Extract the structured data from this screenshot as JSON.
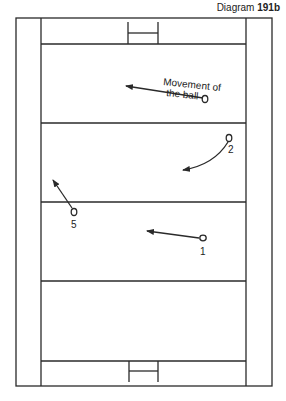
{
  "caption": {
    "prefix": "Diagram",
    "number": "191b"
  },
  "annotation": {
    "line1": "Movement of",
    "line2": "the ball"
  },
  "players": [
    {
      "label": "1"
    },
    {
      "label": "2"
    },
    {
      "label": "5"
    }
  ],
  "colors": {
    "line": "#2a2a2a",
    "background": "#ffffff"
  }
}
